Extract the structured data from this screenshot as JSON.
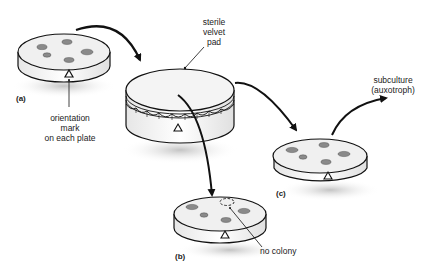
{
  "diagram": {
    "colors": {
      "line": "#111111",
      "plate_top": "#f2f2f2",
      "plate_side": "#fafafa",
      "colony": "#8a8a8a",
      "shadow": "#cccccc",
      "text": "#222222"
    },
    "plates": [
      {
        "id": "a",
        "label": "(a)",
        "colonies": 5,
        "role": "master plate"
      },
      {
        "id": "pad",
        "label": "sterile velvet pad",
        "role": "transfer"
      },
      {
        "id": "b",
        "label": "(b)",
        "colonies": 4,
        "missing_colonies": 1,
        "role": "minimal medium"
      },
      {
        "id": "c",
        "label": "(c)",
        "colonies": 5,
        "role": "complete medium"
      }
    ],
    "labels": {
      "a": "(a)",
      "b": "(b)",
      "c": "(c)",
      "pad_line1": "sterile",
      "pad_line2": "velvet",
      "pad_line3": "pad",
      "orientation_line1": "orientation",
      "orientation_line2": "mark",
      "orientation_line3": "on each plate",
      "no_colony": "no colony",
      "subculture_line1": "subculture",
      "subculture_line2": "(auxotroph)"
    },
    "arrows": [
      {
        "from": "a",
        "to": "pad"
      },
      {
        "from": "pad",
        "to": "b"
      },
      {
        "from": "pad",
        "to": "c"
      },
      {
        "from": "c",
        "to": "subculture"
      }
    ]
  }
}
